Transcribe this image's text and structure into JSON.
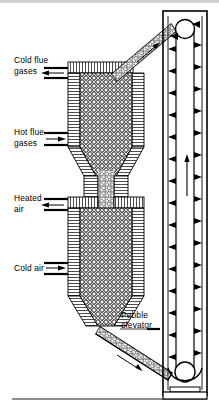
{
  "figure": {
    "type": "process-flow-diagram",
    "ink_color": "#000000",
    "background_color": "#ffffff",
    "pebble_fill_color": "#ffffff",
    "hatch_color": "#000000"
  },
  "labels": {
    "cold_flue_gases": {
      "line1": "Cold flue",
      "line2": "gases",
      "flow": "out",
      "arrow": "left"
    },
    "hot_flue_gases": {
      "line1": "Hot flue",
      "line2": "gases",
      "flow": "in",
      "arrow": "right"
    },
    "heated_air": {
      "line1": "Heated",
      "line2": "air",
      "flow": "out",
      "arrow": "left"
    },
    "cold_air": {
      "line1": "Cold air",
      "line2": "",
      "flow": "in",
      "arrow": "right"
    },
    "pebble_elevator": {
      "line1": "Pebble",
      "line2": "elevator",
      "flow": "",
      "arrow": "right"
    }
  },
  "components": {
    "upper_vessel": "flue-gas heated pebble bed",
    "lower_vessel": "air heating pebble bed",
    "throat": "pebble transfer throat",
    "top_chute": "pebble feed chute from elevator",
    "bottom_chute": "pebble discharge chute to elevator boot",
    "elevator_casing": "bucket elevator casing",
    "head_pulley": "head pulley",
    "boot_pulley": "boot pulley",
    "base": "elevator base pedestal",
    "ground_line": "ground line"
  },
  "flow_arrows": {
    "top_chute_direction": "up-left",
    "bottom_chute_direction": "down-right",
    "elevator_belt_direction": "up",
    "descending_strand": "left-facing buckets",
    "ascending_strand": "right-facing buckets"
  }
}
